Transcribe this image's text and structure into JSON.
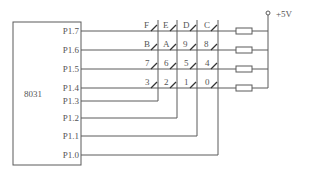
{
  "diagram": {
    "type": "circuit-schematic",
    "chip": {
      "label": "8031"
    },
    "pins": [
      {
        "label": "P1.7",
        "role": "row",
        "y": 31
      },
      {
        "label": "P1.6",
        "role": "row",
        "y": 50
      },
      {
        "label": "P1.5",
        "role": "row",
        "y": 69
      },
      {
        "label": "P1.4",
        "role": "row",
        "y": 88
      },
      {
        "label": "P1.3",
        "role": "column",
        "y": 101
      },
      {
        "label": "P1.2",
        "role": "column",
        "y": 118
      },
      {
        "label": "P1.1",
        "role": "column",
        "y": 136
      },
      {
        "label": "P1.0",
        "role": "column",
        "y": 155
      }
    ],
    "keys": [
      [
        "F",
        "E",
        "D",
        "C"
      ],
      [
        "B",
        "A",
        "9",
        "8"
      ],
      [
        "7",
        "6",
        "5",
        "4"
      ],
      [
        "3",
        "2",
        "1",
        "0"
      ]
    ],
    "supply": {
      "label": "+5V"
    },
    "resistors": {
      "count": 4,
      "type": "pull-up"
    }
  }
}
